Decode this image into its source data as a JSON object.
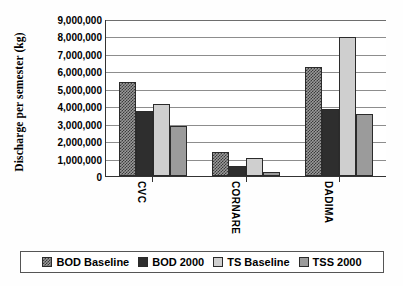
{
  "chart_data": {
    "type": "bar",
    "title": "",
    "xlabel": "",
    "ylabel": "Discharge per semester (kg)",
    "ylim": [
      0,
      9000000
    ],
    "grid": true,
    "legend_position": "bottom",
    "categories": [
      "CVC",
      "CORNARE",
      "DADIMA"
    ],
    "ytick_labels": [
      "9,000,000",
      "8,000,000",
      "7,000,000",
      "6,000,000",
      "5,000,000",
      "4,000,000",
      "3,000,000",
      "2,000,000",
      "1,000,000",
      "0"
    ],
    "ytick_values": [
      9000000,
      8000000,
      7000000,
      6000000,
      5000000,
      4000000,
      3000000,
      2000000,
      1000000,
      0
    ],
    "series": [
      {
        "name": "BOD Baseline",
        "color": "#9a9a9a",
        "pattern": "stipple",
        "values": [
          5400000,
          1350000,
          6250000
        ]
      },
      {
        "name": "BOD 2000",
        "color": "#2e2e2e",
        "pattern": "solid-dark",
        "values": [
          3700000,
          550000,
          3850000
        ]
      },
      {
        "name": "TS Baseline",
        "color": "#cfcfcf",
        "pattern": "solid-light",
        "values": [
          4100000,
          1050000,
          7950000
        ]
      },
      {
        "name": "TSS 2000",
        "color": "#9b9b9b",
        "pattern": "solid-mid",
        "values": [
          2850000,
          250000,
          3550000
        ]
      }
    ]
  },
  "legend": {
    "items": [
      {
        "label": "BOD Baseline"
      },
      {
        "label": "BOD 2000"
      },
      {
        "label": "TS Baseline"
      },
      {
        "label": "TSS 2000"
      }
    ]
  }
}
